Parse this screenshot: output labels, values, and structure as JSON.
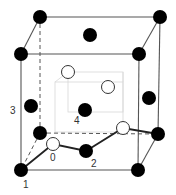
{
  "diagram": {
    "type": "crystal unit cell",
    "colors": {
      "edge": "#555555",
      "inner_edge": "#d8d8d8",
      "filled_atom": "#000000",
      "open_atom_fill": "#ffffff",
      "open_atom_stroke": "#333333",
      "label": "#333333"
    },
    "labels": {
      "l0": "0",
      "l1": "1",
      "l2": "2",
      "l3": "3",
      "l4": "4"
    },
    "filled_atoms": [
      {
        "name": "corner-back-top-left",
        "x": 40,
        "y": 17
      },
      {
        "name": "corner-back-top-right",
        "x": 160,
        "y": 17
      },
      {
        "name": "corner-front-top-left",
        "x": 21,
        "y": 54
      },
      {
        "name": "corner-front-top-right",
        "x": 139,
        "y": 54
      },
      {
        "name": "corner-back-bottom-left",
        "x": 40,
        "y": 133
      },
      {
        "name": "corner-back-bottom-right",
        "x": 158,
        "y": 134
      },
      {
        "name": "corner-front-bottom-left",
        "x": 21,
        "y": 170
      },
      {
        "name": "corner-front-bottom-right",
        "x": 138,
        "y": 170
      },
      {
        "name": "face-top",
        "x": 90,
        "y": 35
      },
      {
        "name": "face-left",
        "x": 31,
        "y": 106
      },
      {
        "name": "face-right",
        "x": 149,
        "y": 98
      },
      {
        "name": "center-4",
        "x": 85,
        "y": 110
      },
      {
        "name": "face-bottom-2",
        "x": 86,
        "y": 151
      }
    ],
    "open_atoms": [
      {
        "name": "interstitial-upper-left",
        "x": 68,
        "y": 72
      },
      {
        "name": "interstitial-upper-right",
        "x": 108,
        "y": 87
      },
      {
        "name": "interstitial-0",
        "x": 53,
        "y": 144
      },
      {
        "name": "interstitial-lower-right",
        "x": 123,
        "y": 128
      }
    ]
  }
}
